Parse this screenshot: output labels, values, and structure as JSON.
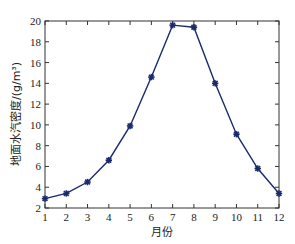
{
  "chart_data": {
    "type": "line",
    "title": "",
    "xlabel": "月份",
    "ylabel": "地面水汽密度/(g/m³)",
    "x": [
      1,
      2,
      3,
      4,
      5,
      6,
      7,
      8,
      9,
      10,
      11,
      12
    ],
    "categories": [
      "1",
      "2",
      "3",
      "4",
      "5",
      "6",
      "7",
      "8",
      "9",
      "10",
      "11",
      "12"
    ],
    "series": [
      {
        "name": "地面水汽密度",
        "values": [
          2.9,
          3.4,
          4.5,
          6.6,
          9.9,
          14.6,
          19.6,
          19.4,
          14.0,
          9.1,
          5.8,
          3.4
        ],
        "color": "#1a2a6c",
        "marker": "asterisk"
      }
    ],
    "xlim": [
      1,
      12
    ],
    "ylim": [
      2,
      20
    ],
    "xticks": [
      1,
      2,
      3,
      4,
      5,
      6,
      7,
      8,
      9,
      10,
      11,
      12
    ],
    "yticks": [
      2,
      4,
      6,
      8,
      10,
      12,
      14,
      16,
      18,
      20
    ],
    "grid": false,
    "legend": null
  }
}
